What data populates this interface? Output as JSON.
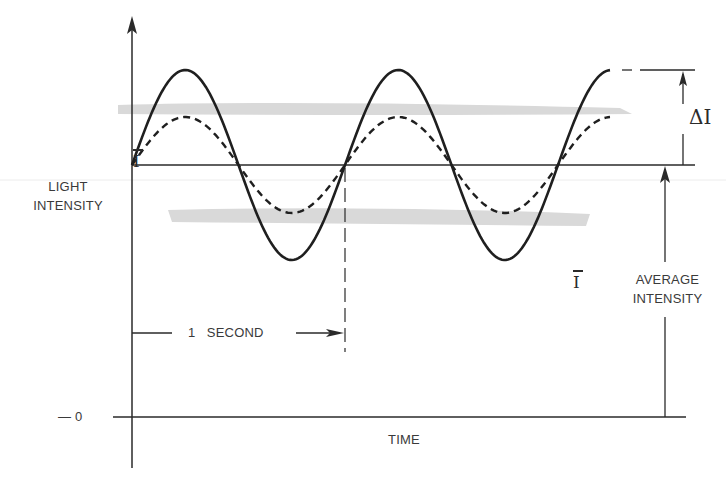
{
  "figure": {
    "type": "diagram",
    "axes": {
      "y_label_line1": "LIGHT",
      "y_label_line2": "INTENSITY",
      "x_label": "TIME",
      "zero_label": "— 0"
    },
    "annotations": {
      "mean_symbol": "I",
      "delta_label": "ΔI",
      "average_symbol": "I",
      "average_label_line1": "AVERAGE",
      "average_label_line2": "INTENSITY",
      "period_label": "1   SECOND"
    },
    "curves": [
      {
        "name": "solid-wave",
        "style": "solid",
        "amplitude_px": 95,
        "period_px": 213,
        "cycles": 2.25
      },
      {
        "name": "dashed-wave",
        "style": "dashed",
        "amplitude_px": 48,
        "period_px": 213,
        "cycles": 2.25
      }
    ],
    "colors": {
      "ink": "#222222",
      "text": "#3a3a3a",
      "smudge": "#d6d6d6"
    }
  }
}
